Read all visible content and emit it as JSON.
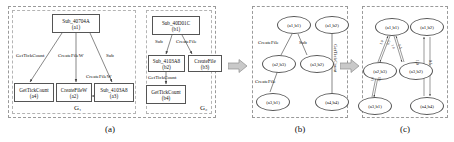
{
  "figure": {
    "captions": {
      "a": "(a)",
      "b": "(b)",
      "c": "(c)"
    },
    "group_labels": {
      "g1": "G₁",
      "g2": "G₂"
    }
  },
  "panel_a": {
    "graph_g1": {
      "nodes": [
        {
          "name": "Sub_40704A",
          "id": "(a1)"
        },
        {
          "name": "GetTickCount",
          "id": "(a4)"
        },
        {
          "name": "CreateFileW",
          "id": "(a2)"
        },
        {
          "name": "Sub_4103A8",
          "id": "(a3)"
        }
      ],
      "edge_labels": [
        "GetTickCount",
        "CreateFileW",
        "Sub",
        "CreateFileW"
      ]
    },
    "graph_g2": {
      "nodes": [
        {
          "name": "Sub_40D01C",
          "id": "(b1)"
        },
        {
          "name": "Sub_4103A8",
          "id": "(b2)"
        },
        {
          "name": "CreateFile",
          "id": "(b3)"
        },
        {
          "name": "GetTickCount",
          "id": "(b4)"
        }
      ],
      "edge_labels": [
        "Sub",
        "CreateFile",
        "GetTickCount"
      ]
    }
  },
  "panel_b": {
    "nodes": [
      {
        "label": "(a1,b1)"
      },
      {
        "label": "(a1,b2)"
      },
      {
        "label": "(a2,b3)"
      },
      {
        "label": "(a3,b2)"
      },
      {
        "label": "(a3,b1)"
      },
      {
        "label": "(a4,b4)"
      }
    ],
    "edge_labels": [
      "CreateFile",
      "Sub",
      "CreateFile",
      "GetTickCount"
    ]
  },
  "panel_c": {
    "nodes": [
      {
        "label": "(a1,b1)"
      },
      {
        "label": "(a1,b2)"
      },
      {
        "label": "(a2,b3)"
      },
      {
        "label": "(a3,b2)"
      },
      {
        "label": "(a3,b1)"
      },
      {
        "label": "(a4,b4)"
      }
    ],
    "weights": [
      "1.0",
      "0.5",
      "1.0",
      "0.5",
      "1.0",
      "0.5",
      "1.0",
      "0.5"
    ]
  }
}
